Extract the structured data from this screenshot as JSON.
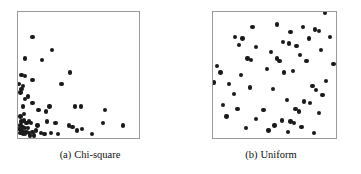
{
  "figure": {
    "background_color": "#ffffff",
    "frame_color": "#9b9b9b",
    "marker_color": "#1a1a1a"
  },
  "panels": [
    {
      "id": "chi-square",
      "caption_tag": "(a)",
      "caption_label": "Chi-square"
    },
    {
      "id": "uniform",
      "caption_tag": "(b)",
      "caption_label": "Uniform"
    }
  ],
  "chart_data": [
    {
      "type": "scatter",
      "title": "(a) Chi-square",
      "xlabel": "",
      "ylabel": "",
      "xlim": [
        0,
        1
      ],
      "ylim": [
        0,
        1
      ],
      "grid": false,
      "legend": "none",
      "marker": "filled-circle",
      "marker_color": "#1a1a1a",
      "series": [
        {
          "name": "chi-square sample",
          "points": [
            [
              0.12,
              0.8
            ],
            [
              0.28,
              0.7
            ],
            [
              0.06,
              0.63
            ],
            [
              0.2,
              0.62
            ],
            [
              0.03,
              0.5
            ],
            [
              0.06,
              0.49
            ],
            [
              0.43,
              0.52
            ],
            [
              0.12,
              0.46
            ],
            [
              0.01,
              0.43
            ],
            [
              0.04,
              0.41
            ],
            [
              0.03,
              0.39
            ],
            [
              0.02,
              0.36
            ],
            [
              0.36,
              0.43
            ],
            [
              0.08,
              0.33
            ],
            [
              0.06,
              0.31
            ],
            [
              0.12,
              0.28
            ],
            [
              0.26,
              0.25
            ],
            [
              0.47,
              0.25
            ],
            [
              0.52,
              0.25
            ],
            [
              0.17,
              0.22
            ],
            [
              0.23,
              0.21
            ],
            [
              0.04,
              0.25
            ],
            [
              0.72,
              0.22
            ],
            [
              0.02,
              0.17
            ],
            [
              0.05,
              0.14
            ],
            [
              0.03,
              0.13
            ],
            [
              0.07,
              0.12
            ],
            [
              0.09,
              0.13
            ],
            [
              0.11,
              0.12
            ],
            [
              0.02,
              0.1
            ],
            [
              0.04,
              0.09
            ],
            [
              0.06,
              0.08
            ],
            [
              0.08,
              0.08
            ],
            [
              0.03,
              0.06
            ],
            [
              0.05,
              0.05
            ],
            [
              0.07,
              0.05
            ],
            [
              0.02,
              0.04
            ],
            [
              0.04,
              0.03
            ],
            [
              0.06,
              0.03
            ],
            [
              0.09,
              0.04
            ],
            [
              0.12,
              0.05
            ],
            [
              0.15,
              0.06
            ],
            [
              0.19,
              0.04
            ],
            [
              0.22,
              0.03
            ],
            [
              0.27,
              0.04
            ],
            [
              0.31,
              0.12
            ],
            [
              0.42,
              0.1
            ],
            [
              0.45,
              0.09
            ],
            [
              0.49,
              0.06
            ],
            [
              0.53,
              0.07
            ],
            [
              0.61,
              0.03
            ],
            [
              0.7,
              0.12
            ],
            [
              0.87,
              0.1
            ],
            [
              0.33,
              0.03
            ],
            [
              0.24,
              0.13
            ],
            [
              0.16,
              0.1
            ],
            [
              0.1,
              0.02
            ],
            [
              0.13,
              0.02
            ],
            [
              0.01,
              0.07
            ],
            [
              0.05,
              0.19
            ]
          ]
        }
      ]
    },
    {
      "type": "scatter",
      "title": "(b) Uniform",
      "xlabel": "",
      "ylabel": "",
      "xlim": [
        0,
        1
      ],
      "ylim": [
        0,
        1
      ],
      "grid": false,
      "legend": "none",
      "marker": "filled-circle",
      "marker_color": "#1a1a1a",
      "series": [
        {
          "name": "uniform sample",
          "points": [
            [
              0.91,
              0.99
            ],
            [
              0.32,
              0.88
            ],
            [
              0.52,
              0.9
            ],
            [
              0.73,
              0.88
            ],
            [
              0.83,
              0.86
            ],
            [
              0.86,
              0.85
            ],
            [
              0.63,
              0.84
            ],
            [
              0.18,
              0.8
            ],
            [
              0.24,
              0.79
            ],
            [
              0.78,
              0.79
            ],
            [
              0.95,
              0.8
            ],
            [
              0.21,
              0.74
            ],
            [
              0.57,
              0.76
            ],
            [
              0.62,
              0.75
            ],
            [
              0.68,
              0.73
            ],
            [
              0.35,
              0.72
            ],
            [
              0.88,
              0.7
            ],
            [
              0.47,
              0.68
            ],
            [
              0.71,
              0.66
            ],
            [
              0.28,
              0.63
            ],
            [
              0.31,
              0.62
            ],
            [
              0.52,
              0.63
            ],
            [
              0.54,
              0.61
            ],
            [
              0.76,
              0.61
            ],
            [
              0.98,
              0.59
            ],
            [
              0.03,
              0.57
            ],
            [
              0.06,
              0.52
            ],
            [
              0.44,
              0.55
            ],
            [
              0.23,
              0.5
            ],
            [
              0.58,
              0.52
            ],
            [
              0.65,
              0.53
            ],
            [
              0.01,
              0.44
            ],
            [
              0.13,
              0.43
            ],
            [
              0.92,
              0.45
            ],
            [
              0.3,
              0.4
            ],
            [
              0.49,
              0.39
            ],
            [
              0.81,
              0.41
            ],
            [
              0.84,
              0.38
            ],
            [
              0.17,
              0.35
            ],
            [
              0.89,
              0.34
            ],
            [
              0.6,
              0.3
            ],
            [
              0.74,
              0.29
            ],
            [
              0.79,
              0.28
            ],
            [
              0.08,
              0.26
            ],
            [
              0.2,
              0.23
            ],
            [
              0.41,
              0.22
            ],
            [
              0.67,
              0.23
            ],
            [
              0.7,
              0.21
            ],
            [
              0.86,
              0.2
            ],
            [
              0.11,
              0.17
            ],
            [
              0.35,
              0.15
            ],
            [
              0.56,
              0.14
            ],
            [
              0.63,
              0.13
            ],
            [
              0.66,
              0.12
            ],
            [
              0.5,
              0.1
            ],
            [
              0.72,
              0.09
            ],
            [
              0.27,
              0.08
            ],
            [
              0.45,
              0.06
            ],
            [
              0.61,
              0.05
            ],
            [
              0.82,
              0.04
            ]
          ]
        }
      ]
    }
  ]
}
